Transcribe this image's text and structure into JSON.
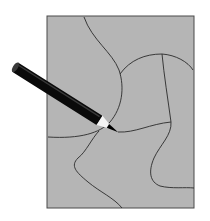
{
  "figure": {
    "colors": {
      "background": "#ffffff",
      "sheet_fill": "#b5b5b5",
      "sheet_border": "#4a4a4a",
      "boundary_line": "#2a2a2a",
      "pencil_body": "#0a0a0a",
      "pencil_cap": "#3a3a3a",
      "pencil_wood": "#f4f4f4",
      "pencil_lead": "#000000"
    },
    "sheet": {
      "x": 47,
      "y": 16,
      "width": 147,
      "height": 192
    },
    "boundaries": [
      {
        "name": "boundary-top-left",
        "d": "M84,17 C92,40 112,52 119,70 C125,88 122,108 110,122 C100,133 80,139 48,137"
      },
      {
        "name": "boundary-arc",
        "d": "M120,74 C130,60 145,54 162,54 C176,55 188,62 193,70"
      },
      {
        "name": "boundary-vertical",
        "d": "M162,54 C164,75 168,100 171,122"
      },
      {
        "name": "boundary-middle",
        "d": "M118,132 C135,133 150,124 171,122"
      },
      {
        "name": "boundary-right-wave",
        "d": "M171,122 C172,135 160,145 154,158 C148,172 150,182 160,186 C172,189 185,187 194,188"
      },
      {
        "name": "boundary-bottom",
        "d": "M99,131 C92,138 86,152 78,158 C70,166 76,172 88,182 C100,192 114,198 122,208"
      }
    ],
    "pencil": {
      "tail_x": 15,
      "tail_y": 67,
      "tip_x": 118,
      "tip_y": 132
    }
  }
}
